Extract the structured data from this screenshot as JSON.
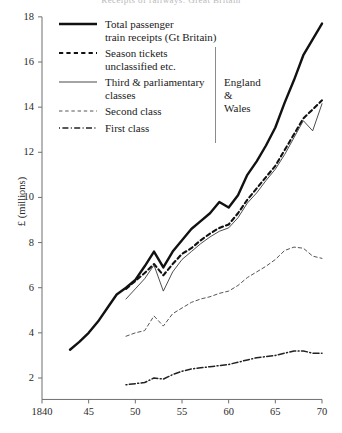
{
  "figure": {
    "title_cropped": "Receipts of railways: Great Britain",
    "ylabel": "£ (millions)"
  },
  "legend": {
    "items": [
      {
        "label": "Total passenger\ntrain receipts (Gt Britain)",
        "style": "solid-thick",
        "name": "legend-total-passenger"
      },
      {
        "label": "Season tickets\nunclassified etc.",
        "style": "dashed-thick",
        "name": "legend-season-tickets"
      },
      {
        "label": "Third & parliamentary\nclasses",
        "style": "solid-thin",
        "name": "legend-third-parliamentary"
      },
      {
        "label": "Second class",
        "style": "dotted-thin",
        "name": "legend-second-class"
      },
      {
        "label": "First class",
        "style": "dash-dot",
        "name": "legend-first-class"
      }
    ],
    "group_brace_label": "England\n&\nWales"
  },
  "chart_data": {
    "type": "line",
    "title": "Receipts of railways: Great Britain",
    "xlabel": "",
    "ylabel": "£ (millions)",
    "xlim": [
      1840,
      1870
    ],
    "ylim": [
      1,
      18
    ],
    "xticks": [
      1840,
      1845,
      1850,
      1855,
      1860,
      1865,
      1870
    ],
    "xticklabels": [
      "1840",
      "45",
      "50",
      "55",
      "60",
      "65",
      "70"
    ],
    "yticks": [
      2,
      4,
      6,
      8,
      10,
      12,
      14,
      16,
      18
    ],
    "yticklabels": [
      "2",
      "4",
      "6",
      "8",
      "10",
      "12",
      "14",
      "16",
      "18"
    ],
    "grid": false,
    "legend_position": "upper-left",
    "series": [
      {
        "name": "Total passenger train receipts (Gt Britain)",
        "style": "solid-thick",
        "x": [
          1843,
          1844,
          1845,
          1846,
          1847,
          1848,
          1849,
          1850,
          1851,
          1852,
          1853,
          1854,
          1855,
          1856,
          1857,
          1858,
          1859,
          1860,
          1861,
          1862,
          1863,
          1864,
          1865,
          1866,
          1867,
          1868,
          1869,
          1870
        ],
        "y": [
          3.25,
          3.6,
          4.0,
          4.5,
          5.1,
          5.7,
          6.0,
          6.35,
          6.95,
          7.6,
          6.9,
          7.6,
          8.1,
          8.6,
          8.95,
          9.3,
          9.8,
          9.55,
          10.1,
          11.0,
          11.6,
          12.3,
          13.1,
          14.2,
          15.2,
          16.3,
          17.0,
          17.7
        ]
      },
      {
        "name": "Season tickets unclassified etc.",
        "style": "dashed-thick",
        "x": [
          1849,
          1850,
          1851,
          1852,
          1853,
          1854,
          1855,
          1856,
          1857,
          1858,
          1859,
          1860,
          1861,
          1862,
          1863,
          1864,
          1865,
          1866,
          1867,
          1868,
          1869,
          1870
        ],
        "y": [
          5.95,
          6.3,
          6.65,
          7.05,
          6.55,
          7.05,
          7.5,
          7.75,
          8.1,
          8.4,
          8.65,
          8.8,
          9.3,
          9.9,
          10.4,
          10.9,
          11.4,
          12.1,
          12.8,
          13.5,
          13.9,
          14.3
        ]
      },
      {
        "name": "Third & parliamentary classes",
        "style": "solid-thin",
        "x": [
          1849,
          1850,
          1851,
          1852,
          1853,
          1854,
          1855,
          1856,
          1857,
          1858,
          1859,
          1860,
          1861,
          1862,
          1863,
          1864,
          1865,
          1866,
          1867,
          1868,
          1869,
          1870
        ],
        "y": [
          5.5,
          5.95,
          6.4,
          7.0,
          5.85,
          6.7,
          7.25,
          7.6,
          7.95,
          8.25,
          8.5,
          8.65,
          9.1,
          9.75,
          10.2,
          10.75,
          11.25,
          11.9,
          12.65,
          13.4,
          12.95,
          14.15
        ]
      },
      {
        "name": "Second class",
        "style": "dotted-thin",
        "x": [
          1849,
          1850,
          1851,
          1852,
          1853,
          1854,
          1855,
          1856,
          1857,
          1858,
          1859,
          1860,
          1861,
          1862,
          1863,
          1864,
          1865,
          1866,
          1867,
          1868,
          1869,
          1870
        ],
        "y": [
          3.85,
          4.0,
          4.1,
          4.75,
          4.3,
          4.85,
          5.1,
          5.35,
          5.5,
          5.6,
          5.75,
          5.85,
          6.1,
          6.45,
          6.7,
          6.95,
          7.25,
          7.65,
          7.8,
          7.75,
          7.4,
          7.3
        ]
      },
      {
        "name": "First class",
        "style": "dash-dot",
        "x": [
          1849,
          1850,
          1851,
          1852,
          1853,
          1854,
          1855,
          1856,
          1857,
          1858,
          1859,
          1860,
          1861,
          1862,
          1863,
          1864,
          1865,
          1866,
          1867,
          1868,
          1869,
          1870
        ],
        "y": [
          1.7,
          1.75,
          1.8,
          2.0,
          1.95,
          2.15,
          2.3,
          2.4,
          2.45,
          2.5,
          2.55,
          2.6,
          2.7,
          2.8,
          2.9,
          2.95,
          3.0,
          3.1,
          3.2,
          3.2,
          3.1,
          3.1
        ]
      }
    ]
  }
}
